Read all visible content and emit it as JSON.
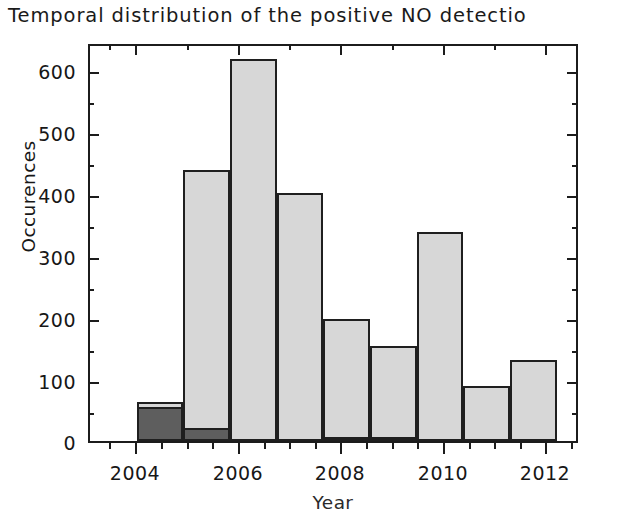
{
  "chart_data": {
    "type": "bar",
    "title": "Temporal distribution of the positive NO detectio",
    "xlabel": "Year",
    "ylabel": "Occurences",
    "categories": [
      2004,
      2005,
      2006,
      2007,
      2008,
      2009,
      2010,
      2011,
      2012
    ],
    "bar_span_years": [
      2004,
      2013
    ],
    "xlim": [
      2003,
      2013.5
    ],
    "ylim": [
      0,
      645
    ],
    "y_ticks": [
      0,
      100,
      200,
      300,
      400,
      500,
      600
    ],
    "y_tick_labels": [
      "0",
      "100",
      "200",
      "300",
      "400",
      "500",
      "600"
    ],
    "y_minor_interval": 50,
    "x_ticks": [
      2004,
      2006,
      2008,
      2010,
      2012
    ],
    "x_tick_labels": [
      "2004",
      "2006",
      "2008",
      "2010",
      "2012"
    ],
    "x_minor_interval": 0.5,
    "grid": false,
    "legend": null,
    "series": [
      {
        "name": "total",
        "color": "#d7d7d7",
        "values": [
          63,
          438,
          617,
          401,
          197,
          154,
          338,
          89,
          131
        ]
      },
      {
        "name": "subset",
        "color": "#5e5e5e",
        "values": [
          55,
          21,
          0,
          0,
          4,
          4,
          0,
          0,
          0
        ]
      }
    ]
  },
  "figure": {
    "title": "Temporal distribution of the positive NO detectio",
    "axis": {
      "y_title": "Occurences",
      "x_title": "Year",
      "y_tick_labels": [
        "600",
        "500",
        "400",
        "300",
        "200",
        "100",
        "0"
      ],
      "x_tick_labels": [
        "2004",
        "2006",
        "2008",
        "2010",
        "2012"
      ]
    },
    "colors": {
      "bar_light": "#d7d7d7",
      "bar_dark": "#5e5e5e",
      "frame": "#1c1c1c",
      "background": "#ffffff",
      "text": "#171717"
    }
  }
}
